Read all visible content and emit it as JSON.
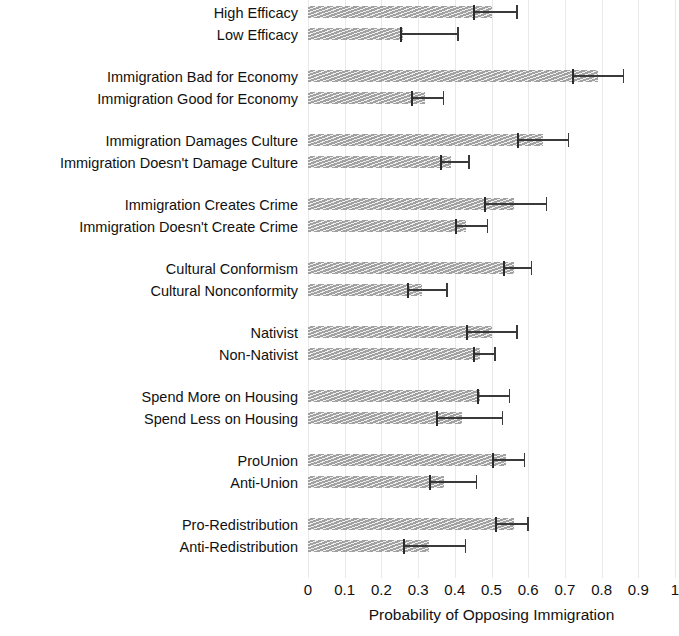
{
  "chart_data": {
    "type": "bar",
    "orientation": "horizontal",
    "title": "",
    "xlabel": "Probability of Opposing Immigration",
    "ylabel": "",
    "xlim": [
      0,
      1
    ],
    "xticks": [
      "0",
      "0.1",
      "0.2",
      "0.3",
      "0.4",
      "0.5",
      "0.6",
      "0.7",
      "0.8",
      "0.9",
      "1"
    ],
    "xtick_values": [
      0,
      0.1,
      0.2,
      0.3,
      0.4,
      0.5,
      0.6,
      0.7,
      0.8,
      0.9,
      1
    ],
    "grid": true,
    "grid_axis": "x",
    "legend": "none",
    "bar_color": "#9c9c9c",
    "errorbar_color": "#3a3a3a",
    "groups": [
      {
        "name": "Efficacy",
        "rows": [
          {
            "category": "High Efficacy",
            "value": 0.5,
            "ci_low": 0.45,
            "ci_high": 0.57
          },
          {
            "category": "Low Efficacy",
            "value": 0.26,
            "ci_low": 0.25,
            "ci_high": 0.41
          }
        ]
      },
      {
        "name": "Economy",
        "rows": [
          {
            "category": "Immigration Bad for Economy",
            "value": 0.79,
            "ci_low": 0.72,
            "ci_high": 0.86
          },
          {
            "category": "Immigration Good for Economy",
            "value": 0.32,
            "ci_low": 0.28,
            "ci_high": 0.37
          }
        ]
      },
      {
        "name": "Culture",
        "rows": [
          {
            "category": "Immigration Damages Culture",
            "value": 0.64,
            "ci_low": 0.57,
            "ci_high": 0.71
          },
          {
            "category": "Immigration Doesn't Damage Culture",
            "value": 0.39,
            "ci_low": 0.36,
            "ci_high": 0.44
          }
        ]
      },
      {
        "name": "Crime",
        "rows": [
          {
            "category": "Immigration Creates Crime",
            "value": 0.56,
            "ci_low": 0.48,
            "ci_high": 0.65
          },
          {
            "category": "Immigration Doesn't Create Crime",
            "value": 0.43,
            "ci_low": 0.4,
            "ci_high": 0.49
          }
        ]
      },
      {
        "name": "Conformism",
        "rows": [
          {
            "category": "Cultural Conformism",
            "value": 0.56,
            "ci_low": 0.53,
            "ci_high": 0.61
          },
          {
            "category": "Cultural Nonconformity",
            "value": 0.31,
            "ci_low": 0.27,
            "ci_high": 0.38
          }
        ]
      },
      {
        "name": "Nativism",
        "rows": [
          {
            "category": "Nativist",
            "value": 0.5,
            "ci_low": 0.43,
            "ci_high": 0.57
          },
          {
            "category": "Non-Nativist",
            "value": 0.47,
            "ci_low": 0.45,
            "ci_high": 0.51
          }
        ]
      },
      {
        "name": "Housing",
        "rows": [
          {
            "category": "Spend More on Housing",
            "value": 0.47,
            "ci_low": 0.46,
            "ci_high": 0.55
          },
          {
            "category": "Spend Less on Housing",
            "value": 0.42,
            "ci_low": 0.35,
            "ci_high": 0.53
          }
        ]
      },
      {
        "name": "Union",
        "rows": [
          {
            "category": "ProUnion",
            "value": 0.54,
            "ci_low": 0.5,
            "ci_high": 0.59
          },
          {
            "category": "Anti-Union",
            "value": 0.37,
            "ci_low": 0.33,
            "ci_high": 0.46
          }
        ]
      },
      {
        "name": "Redistribution",
        "rows": [
          {
            "category": "Pro-Redistribution",
            "value": 0.56,
            "ci_low": 0.51,
            "ci_high": 0.6
          },
          {
            "category": "Anti-Redistribution",
            "value": 0.33,
            "ci_low": 0.26,
            "ci_high": 0.43
          }
        ]
      }
    ]
  }
}
